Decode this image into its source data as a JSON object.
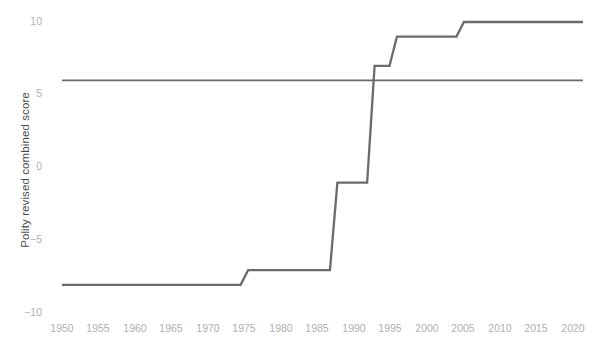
{
  "chart_data": {
    "type": "line",
    "title": "",
    "subtitle": "",
    "xlabel": "",
    "ylabel": "Polity revised combined score",
    "xlim": [
      1950,
      2020
    ],
    "ylim": [
      -10,
      10
    ],
    "grid": false,
    "legend": null,
    "x_ticks": [
      1950,
      1955,
      1960,
      1965,
      1970,
      1975,
      1980,
      1985,
      1990,
      1995,
      2000,
      2005,
      2010,
      2015,
      2020
    ],
    "y_ticks": [
      10,
      5,
      0,
      -5,
      -10
    ],
    "line_color": "#6b6b6b",
    "reference_line_color": "#6b6b6b",
    "series": [
      {
        "name": "Polity revised combined score",
        "type": "step",
        "x": [
          1950,
          1974,
          1975,
          1986,
          1987,
          1991,
          1992,
          1994,
          1995,
          2003,
          2004,
          2020
        ],
        "values": [
          -8,
          -8,
          -7,
          -7,
          -1,
          -1,
          7,
          7,
          9,
          9,
          10,
          10
        ]
      },
      {
        "name": "reference line",
        "type": "horizontal",
        "x": [
          1950,
          2020
        ],
        "values": [
          6,
          6
        ]
      }
    ],
    "annotations": []
  },
  "axis": {
    "y_title": "Polity revised combined score",
    "y_tick_labels": [
      "10",
      "5",
      "0",
      "−5",
      "−10"
    ],
    "x_tick_labels": [
      "1950",
      "1955",
      "1960",
      "1965",
      "1970",
      "1975",
      "1980",
      "1985",
      "1990",
      "1995",
      "2000",
      "2005",
      "2010",
      "2015",
      "2020"
    ]
  }
}
